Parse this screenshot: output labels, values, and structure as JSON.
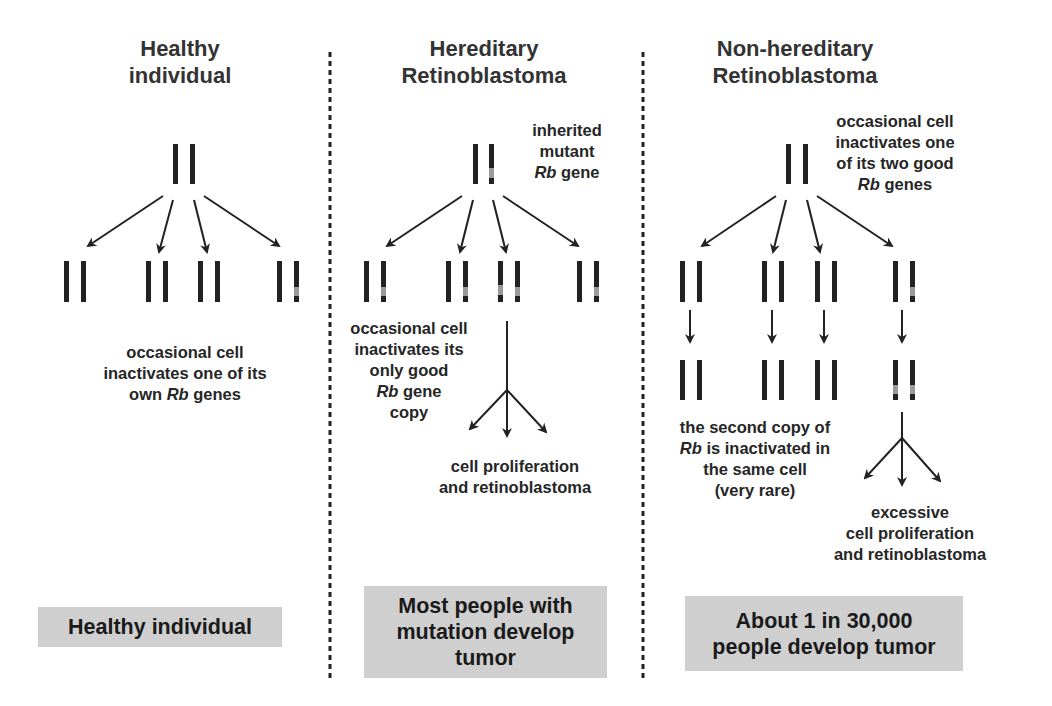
{
  "colors": {
    "chromosome": "#222222",
    "mutation_band": "#9a9a9a",
    "arrow": "#222222",
    "divider": "#222222",
    "summary_box": "#cfcfcf",
    "title_text": "#333333"
  },
  "columns": [
    {
      "id": "healthy",
      "title_lines": [
        "Healthy",
        "individual"
      ],
      "annotation_top": null,
      "annotation_middle": {
        "lines": [
          "occasional cell",
          "inactivates one of its",
          "own |Rb| genes"
        ]
      },
      "outcome_text": null,
      "summary": "Healthy individual"
    },
    {
      "id": "hereditary",
      "title_lines": [
        "Hereditary",
        "Retinoblastoma"
      ],
      "annotation_top": {
        "lines": [
          "inherited",
          "mutant",
          "|Rb| gene"
        ]
      },
      "annotation_middle": {
        "lines": [
          "occasional cell",
          "inactivates its",
          "only good",
          "|Rb| gene",
          "copy"
        ]
      },
      "outcome_text": {
        "lines": [
          "cell proliferation",
          "and retinoblastoma"
        ]
      },
      "summary": "Most people with mutation develop tumor"
    },
    {
      "id": "non-hereditary",
      "title_lines": [
        "Non-hereditary",
        "Retinoblastoma"
      ],
      "annotation_top": {
        "lines": [
          "occasional cell",
          "inactivates one",
          "of its two good",
          "|Rb| genes"
        ]
      },
      "annotation_middle": {
        "lines": [
          "the second copy of",
          "|Rb| is inactivated in",
          "the same cell",
          "(very rare)"
        ]
      },
      "outcome_text": {
        "lines": [
          "excessive",
          "cell proliferation",
          "and retinoblastoma"
        ]
      },
      "summary": "About 1 in 30,000 people develop tumor"
    }
  ],
  "text": {
    "healthy_title_1": "Healthy",
    "healthy_title_2": "individual",
    "healthy_note_1": "occasional cell",
    "healthy_note_2": "inactivates one of its",
    "healthy_note_3a": "own ",
    "healthy_note_3b": "Rb",
    "healthy_note_3c": " genes",
    "healthy_summary": "Healthy individual",
    "hered_title_1": "Hereditary",
    "hered_title_2": "Retinoblastoma",
    "hered_top_1": "inherited",
    "hered_top_2": "mutant",
    "hered_top_3a": "Rb",
    "hered_top_3b": " gene",
    "hered_mid_1": "occasional cell",
    "hered_mid_2": "inactivates its",
    "hered_mid_3": "only good",
    "hered_mid_4a": "Rb",
    "hered_mid_4b": " gene",
    "hered_mid_5": "copy",
    "hered_out_1": "cell proliferation",
    "hered_out_2": "and retinoblastoma",
    "hered_summary_1": "Most people with",
    "hered_summary_2": "mutation develop",
    "hered_summary_3": "tumor",
    "nonhered_title_1": "Non-hereditary",
    "nonhered_title_2": "Retinoblastoma",
    "nonhered_top_1": "occasional cell",
    "nonhered_top_2": "inactivates one",
    "nonhered_top_3": "of its two good",
    "nonhered_top_4a": "Rb",
    "nonhered_top_4b": " genes",
    "nonhered_mid_1": "the second copy of",
    "nonhered_mid_2a": "Rb",
    "nonhered_mid_2b": " is inactivated in",
    "nonhered_mid_3": "the same cell",
    "nonhered_mid_4": "(very rare)",
    "nonhered_out_1": "excessive",
    "nonhered_out_2": "cell proliferation",
    "nonhered_out_3": "and retinoblastoma",
    "nonhered_summary_1": "About 1 in 30,000",
    "nonhered_summary_2": "people develop tumor"
  },
  "icons": {
    "chromosome": "chromosome-pair-icon",
    "arrow": "arrow-icon",
    "divider": "dotted-divider"
  }
}
